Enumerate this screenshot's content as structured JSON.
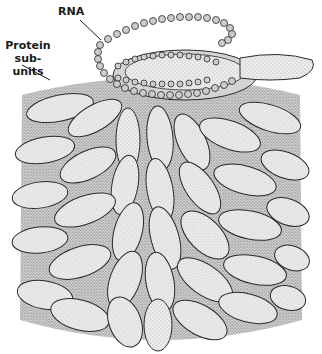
{
  "diagram": {
    "labels": {
      "rna": "RNA",
      "protein_line1": "Protein",
      "protein_line2": "sub-units"
    },
    "colors": {
      "background": "#ffffff",
      "outline": "#2a2a2a",
      "stipple_fill": "#e4e4e4",
      "shadow_fill": "#bdbdbd",
      "bead_fill": "#cfcfcf"
    }
  }
}
